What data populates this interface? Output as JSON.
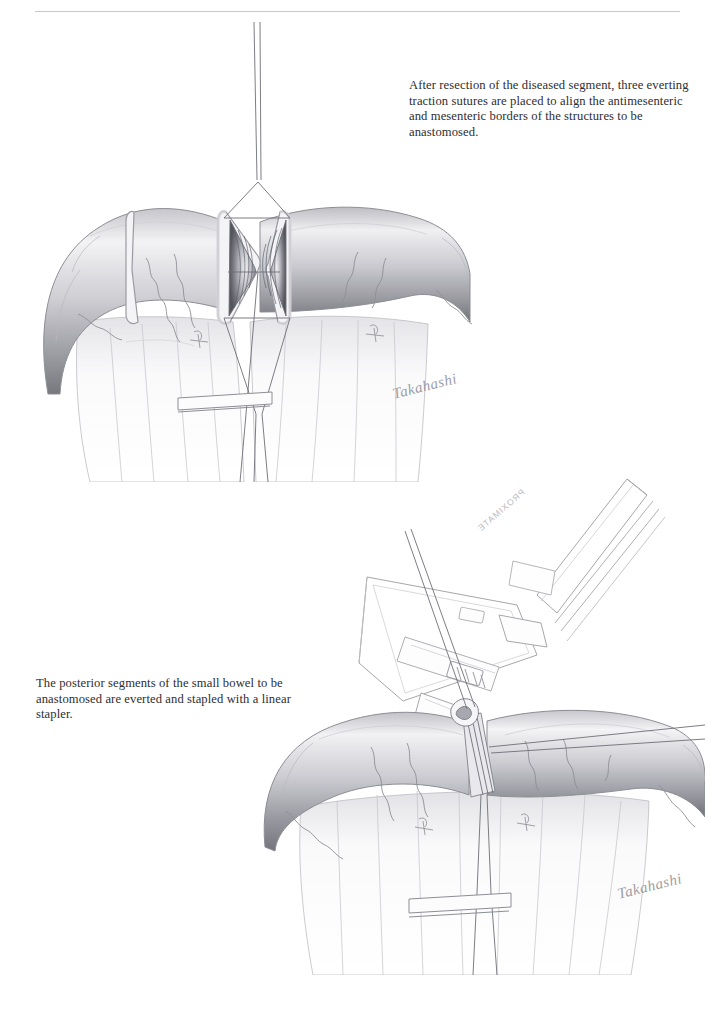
{
  "page": {
    "background": "#ffffff",
    "width": 711,
    "height": 1013,
    "header_rule_color": "#c9c9cc",
    "header_text": ""
  },
  "captions": {
    "top": "After resection of the diseased segment, three everting traction sutures are placed to align the antimesenteric and mesenteric borders of the structures to be anastomosed.",
    "bottom": "The posterior segments of the small bowel to be anastomosed are everted and stapled with a linear stapler."
  },
  "figures": [
    {
      "id": "figure-top",
      "title": "Everted bowel ends with three traction sutures",
      "style": "graphite pencil rendering",
      "elements": [
        "proximal small bowel loop",
        "distal small bowel loop",
        "everted open bowel lumen with mucosal folds",
        "antimesenteric traction suture",
        "mesenteric traction sutures",
        "mesentery with arcade vessels",
        "vessel ligature ties",
        "bowel clamp"
      ]
    },
    {
      "id": "figure-bottom",
      "title": "Posterior bowel segments stapled with a linear stapler",
      "style": "line art instrument over graphite pencil bowel",
      "elements": [
        "linear stapler body",
        "stapler handle",
        "stapler jaw / anvil",
        "stapler cartridge window",
        "traction sutures through stapler",
        "stapled everted posterior wall",
        "small bowel with mesentery",
        "mesenteric arcade vessels",
        "bowel clamp"
      ]
    }
  ],
  "instrument": {
    "brand_label": "PROXIMATE",
    "type": "linear stapler"
  },
  "signature": {
    "artist": "Takahashi",
    "display": "Takahashi"
  },
  "colors": {
    "ink": "#2e2e30",
    "rule": "#c9c9cc",
    "line_art": "#9a9aa0",
    "shading_dark": "#6f6f76",
    "shading_mid": "#a9a9b0",
    "shading_light": "#d8d8dc",
    "signature": "#8d8d93"
  }
}
